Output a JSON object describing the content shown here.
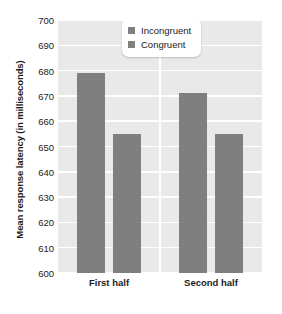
{
  "chart_data": {
    "type": "bar",
    "title": "",
    "xlabel": "",
    "ylabel": "Mean response latency (in milliseconds)",
    "categories": [
      "First half",
      "Second half"
    ],
    "series": [
      {
        "name": "Incongruent",
        "values": [
          679,
          671
        ],
        "color": "#7f7f7f"
      },
      {
        "name": "Congruent",
        "values": [
          655,
          655
        ],
        "color": "#7f7f7f"
      }
    ],
    "ylim": [
      600,
      700
    ],
    "ytick_step": 10,
    "yticks": [
      700,
      690,
      680,
      670,
      660,
      650,
      640,
      630,
      620,
      610,
      600
    ],
    "ytick_labels": [
      "700",
      "690",
      "680",
      "670",
      "660",
      "650",
      "640",
      "630",
      "620",
      "610",
      "600"
    ],
    "grid": true,
    "grid_color": "#ffffff",
    "panel_color": "#e9e9e9",
    "legend_position": "top-right",
    "legend_entries": [
      "Incongruent",
      "Congruent"
    ]
  }
}
